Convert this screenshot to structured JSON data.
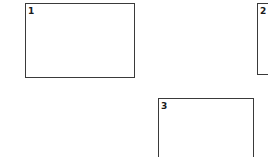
{
  "boxes": [
    {
      "label": "1"
    },
    {
      "label": "2"
    },
    {
      "label": "3"
    }
  ]
}
